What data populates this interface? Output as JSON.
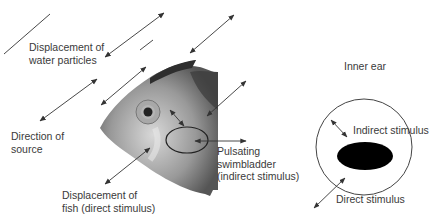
{
  "labels": {
    "water_displacement": [
      "Displacement of",
      "water particles"
    ],
    "direction_source": [
      "Direction of",
      "source"
    ],
    "fish_displacement": [
      "Displacement of",
      "fish (direct stimulus)"
    ],
    "swimbladder": [
      "Pulsating",
      "swimbladder",
      "(indirect stimulus)"
    ],
    "inner_ear_title": "Inner ear",
    "indirect_stimulus": "Indirect stimulus",
    "direct_stimulus": "Direct stimulus"
  },
  "colors": {
    "line": "#333333",
    "text": "#3a3a3a",
    "otolith": "#000000",
    "fish_dark": "#2e2e2e",
    "fish_light": "#cfcfcf"
  }
}
